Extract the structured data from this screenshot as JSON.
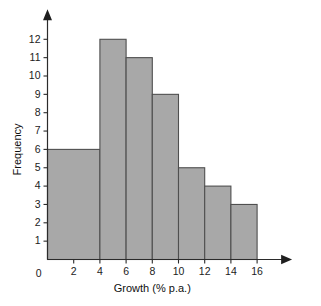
{
  "chart_data": {
    "type": "bar",
    "title": "",
    "subtitle": "",
    "xlabel": "Growth (% p.a.)",
    "ylabel": "Frequency",
    "xlim": [
      0,
      16
    ],
    "ylim": [
      0,
      12
    ],
    "grid": false,
    "legend": null,
    "xticks": [
      "0",
      "2",
      "4",
      "6",
      "8",
      "10",
      "12",
      "14",
      "16"
    ],
    "xtick_values": [
      0,
      2,
      4,
      6,
      8,
      10,
      12,
      14,
      16
    ],
    "yticks": [
      "0",
      "1",
      "2",
      "3",
      "4",
      "5",
      "6",
      "7",
      "8",
      "9",
      "10",
      "11",
      "12"
    ],
    "ytick_values": [
      0,
      1,
      2,
      3,
      4,
      5,
      6,
      7,
      8,
      9,
      10,
      11,
      12
    ],
    "bin_edges": [
      0,
      4,
      6,
      8,
      10,
      12,
      14,
      16
    ],
    "categories": [
      "0-4",
      "4-6",
      "6-8",
      "8-10",
      "10-12",
      "12-14",
      "14-16"
    ],
    "values": [
      6,
      12,
      11,
      9,
      5,
      4,
      3
    ],
    "bars": [
      {
        "label": "0-4",
        "x0": 0,
        "x1": 4,
        "frequency": 6
      },
      {
        "label": "4-6",
        "x0": 4,
        "x1": 6,
        "frequency": 12
      },
      {
        "label": "6-8",
        "x0": 6,
        "x1": 8,
        "frequency": 11
      },
      {
        "label": "8-10",
        "x0": 8,
        "x1": 10,
        "frequency": 9
      },
      {
        "label": "10-12",
        "x0": 10,
        "x1": 12,
        "frequency": 5
      },
      {
        "label": "12-14",
        "x0": 12,
        "x1": 14,
        "frequency": 4
      },
      {
        "label": "14-16",
        "x0": 14,
        "x1": 16,
        "frequency": 3
      }
    ],
    "colors": {
      "bar_fill": "#a8a8a8",
      "bar_stroke": "#4f4f4f",
      "axis": "#2b2b2b",
      "text": "#1b1b1b",
      "background": "#ffffff"
    }
  },
  "cropped_edges": {
    "top_text": "",
    "bottom_text": ""
  }
}
